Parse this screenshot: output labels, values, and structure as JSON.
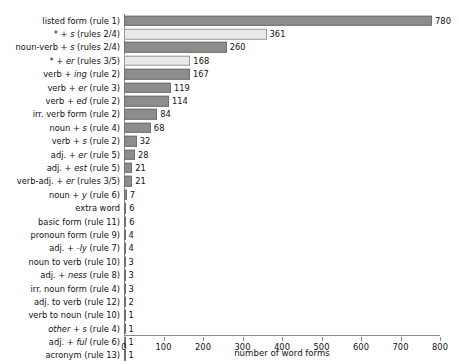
{
  "chart_data": {
    "type": "bar",
    "orientation": "horizontal",
    "title": "",
    "xlabel": "number of word forms",
    "ylabel": "",
    "xlim": [
      0,
      800
    ],
    "xticks": [
      0,
      100,
      200,
      300,
      400,
      500,
      600,
      700,
      800
    ],
    "grid": false,
    "legend": null,
    "categories": [
      "listed form (rule 1)",
      "* + s (rules 2/4)",
      "noun-verb + s (rules 2/4)",
      "* + er (rules 3/5)",
      "verb + ing (rule 2)",
      "verb + er (rule 3)",
      "verb + ed (rule 2)",
      "irr. verb form (rule 2)",
      "noun + s (rule 4)",
      "verb + s (rule 2)",
      "adj. + er (rule 5)",
      "adj. + est (rule 5)",
      "verb-adj. + er (rules 3/5)",
      "noun + y (rule 6)",
      "extra word",
      "basic form (rule 11)",
      "pronoun form (rule 9)",
      "adj. + -ly (rule 7)",
      "noun to verb (rule 10)",
      "adj. + ness (rule 8)",
      "irr. noun form (rule 4)",
      "adj. to verb (rule 12)",
      "verb to noun (rule 10)",
      "other + s (rule 4)",
      "adj. + ful (rule 6)",
      "acronym (rule 13)"
    ],
    "values": [
      780,
      361,
      260,
      168,
      167,
      119,
      114,
      84,
      68,
      32,
      28,
      21,
      21,
      7,
      6,
      6,
      4,
      4,
      3,
      3,
      3,
      2,
      1,
      1,
      1,
      1
    ],
    "rows": [
      {
        "label_plain": "listed form (rule 1)",
        "label_pre": "listed form (rule 1)",
        "label_italic": "",
        "label_post": "",
        "value": 780,
        "shade": "dark"
      },
      {
        "label_plain": "* + s (rules 2/4)",
        "label_pre": "* + ",
        "label_italic": "s",
        "label_post": " (rules 2/4)",
        "value": 361,
        "shade": "light"
      },
      {
        "label_plain": "noun-verb + s (rules 2/4)",
        "label_pre": "noun-verb + ",
        "label_italic": "s",
        "label_post": " (rules 2/4)",
        "value": 260,
        "shade": "dark"
      },
      {
        "label_plain": "* + er (rules 3/5)",
        "label_pre": "* + ",
        "label_italic": "er",
        "label_post": " (rules 3/5)",
        "value": 168,
        "shade": "light"
      },
      {
        "label_plain": "verb + ing (rule 2)",
        "label_pre": "verb + ",
        "label_italic": "ing",
        "label_post": " (rule 2)",
        "value": 167,
        "shade": "dark"
      },
      {
        "label_plain": "verb + er (rule 3)",
        "label_pre": "verb + ",
        "label_italic": "er",
        "label_post": " (rule 3)",
        "value": 119,
        "shade": "dark"
      },
      {
        "label_plain": "verb + ed (rule 2)",
        "label_pre": "verb + ",
        "label_italic": "ed",
        "label_post": " (rule 2)",
        "value": 114,
        "shade": "dark"
      },
      {
        "label_plain": "irr. verb form (rule 2)",
        "label_pre": "irr. verb form (rule 2)",
        "label_italic": "",
        "label_post": "",
        "value": 84,
        "shade": "dark"
      },
      {
        "label_plain": "noun + s (rule 4)",
        "label_pre": "noun + ",
        "label_italic": "s",
        "label_post": " (rule 4)",
        "value": 68,
        "shade": "dark"
      },
      {
        "label_plain": "verb + s (rule 2)",
        "label_pre": "verb + ",
        "label_italic": "s",
        "label_post": " (rule 2)",
        "value": 32,
        "shade": "dark"
      },
      {
        "label_plain": "adj. + er (rule 5)",
        "label_pre": "adj. + ",
        "label_italic": "er",
        "label_post": " (rule 5)",
        "value": 28,
        "shade": "dark"
      },
      {
        "label_plain": "adj. + est (rule 5)",
        "label_pre": "adj. + ",
        "label_italic": "est",
        "label_post": " (rule 5)",
        "value": 21,
        "shade": "dark"
      },
      {
        "label_plain": "verb-adj. + er (rules 3/5)",
        "label_pre": "verb-adj. + ",
        "label_italic": "er",
        "label_post": " (rules 3/5)",
        "value": 21,
        "shade": "dark"
      },
      {
        "label_plain": "noun + y (rule 6)",
        "label_pre": "noun + ",
        "label_italic": "y",
        "label_post": " (rule 6)",
        "value": 7,
        "shade": "dark"
      },
      {
        "label_plain": "extra word",
        "label_pre": "extra word",
        "label_italic": "",
        "label_post": "",
        "value": 6,
        "shade": "dark"
      },
      {
        "label_plain": "basic form (rule 11)",
        "label_pre": "basic form (rule 11)",
        "label_italic": "",
        "label_post": "",
        "value": 6,
        "shade": "dark"
      },
      {
        "label_plain": "pronoun form (rule 9)",
        "label_pre": "pronoun form (rule 9)",
        "label_italic": "",
        "label_post": "",
        "value": 4,
        "shade": "dark"
      },
      {
        "label_plain": "adj. + -ly (rule 7)",
        "label_pre": "adj. + ",
        "label_italic": "-ly",
        "label_post": " (rule 7)",
        "value": 4,
        "shade": "dark"
      },
      {
        "label_plain": "noun to verb (rule 10)",
        "label_pre": "noun to verb (rule 10)",
        "label_italic": "",
        "label_post": "",
        "value": 3,
        "shade": "dark"
      },
      {
        "label_plain": "adj. + ness (rule 8)",
        "label_pre": "adj. + ",
        "label_italic": "ness",
        "label_post": " (rule 8)",
        "value": 3,
        "shade": "dark"
      },
      {
        "label_plain": "irr. noun form (rule 4)",
        "label_pre": "irr. noun form (rule 4)",
        "label_italic": "",
        "label_post": "",
        "value": 3,
        "shade": "dark"
      },
      {
        "label_plain": "adj. to verb (rule 12)",
        "label_pre": "adj. to verb (rule 12)",
        "label_italic": "",
        "label_post": "",
        "value": 2,
        "shade": "dark"
      },
      {
        "label_plain": "verb to noun (rule 10)",
        "label_pre": "verb to noun (rule 10)",
        "label_italic": "",
        "label_post": "",
        "value": 1,
        "shade": "dark"
      },
      {
        "label_plain": "other + s (rule 4)",
        "label_pre": "",
        "label_italic": "other",
        "label_post": " + s (rule 4)",
        "value": 1,
        "shade": "dark"
      },
      {
        "label_plain": "adj. + ful (rule 6)",
        "label_pre": "adj. + ",
        "label_italic": "ful",
        "label_post": " (rule 6)",
        "value": 1,
        "shade": "dark"
      },
      {
        "label_plain": "acronym (rule 13)",
        "label_pre": "acronym (rule 13)",
        "label_italic": "",
        "label_post": "",
        "value": 1,
        "shade": "dark"
      }
    ],
    "colors": {
      "bar_dark": "#8d8d8d",
      "bar_light": "#e9e9e9",
      "bar_dark_edge": "#6f6f6f",
      "bar_light_edge": "#9b9b9b",
      "axis": "#8a8a8a",
      "text": "#111111",
      "background": "#ffffff"
    }
  }
}
